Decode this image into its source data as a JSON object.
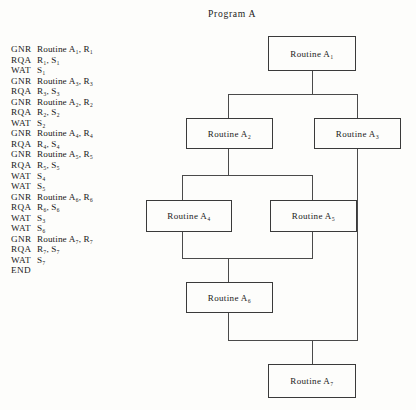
{
  "figure": {
    "chart_title": "Program A"
  },
  "listing": {
    "lines": [
      {
        "op": "GNR",
        "operand": "Routine A₁, R₁"
      },
      {
        "op": "RQA",
        "operand": "R₁, S₁"
      },
      {
        "op": "WAT",
        "operand": "S₁"
      },
      {
        "op": "GNR",
        "operand": "Routine A₃, R₃"
      },
      {
        "op": "RQA",
        "operand": "R₃, S₃"
      },
      {
        "op": "GNR",
        "operand": "Routine A₂, R₂"
      },
      {
        "op": "RQA",
        "operand": "R₂, S₂"
      },
      {
        "op": "WAT",
        "operand": "S₂"
      },
      {
        "op": "GNR",
        "operand": "Routine A₄, R₄"
      },
      {
        "op": "RQA",
        "operand": "R₄, S₄"
      },
      {
        "op": "GNR",
        "operand": "Routine A₅, R₅"
      },
      {
        "op": "RQA",
        "operand": "R₅, S₅"
      },
      {
        "op": "WAT",
        "operand": "S₄"
      },
      {
        "op": "WAT",
        "operand": "S₅"
      },
      {
        "op": "GNR",
        "operand": "Routine A₆, R₆"
      },
      {
        "op": "RQA",
        "operand": "R₆, S₆"
      },
      {
        "op": "WAT",
        "operand": "S₃"
      },
      {
        "op": "WAT",
        "operand": "S₆"
      },
      {
        "op": "GNR",
        "operand": "Routine A₇, R₇"
      },
      {
        "op": "RQA",
        "operand": "R₇, S₇"
      },
      {
        "op": "WAT",
        "operand": "S₇"
      },
      {
        "op": "END",
        "operand": ""
      }
    ]
  },
  "flowchart": {
    "nodes": [
      {
        "id": "a1",
        "label": "Routine A₁"
      },
      {
        "id": "a2",
        "label": "Routine A₂"
      },
      {
        "id": "a3",
        "label": "Routine A₃"
      },
      {
        "id": "a4",
        "label": "Routine A₄"
      },
      {
        "id": "a5",
        "label": "Routine A₅"
      },
      {
        "id": "a6",
        "label": "Routine A₆"
      },
      {
        "id": "a7",
        "label": "Routine A₇"
      }
    ]
  },
  "colors": {
    "background": "#fdfdfb",
    "ink": "#1a1a1a",
    "rule": "#4a4a4a",
    "box_border": "#3a3a3a"
  }
}
